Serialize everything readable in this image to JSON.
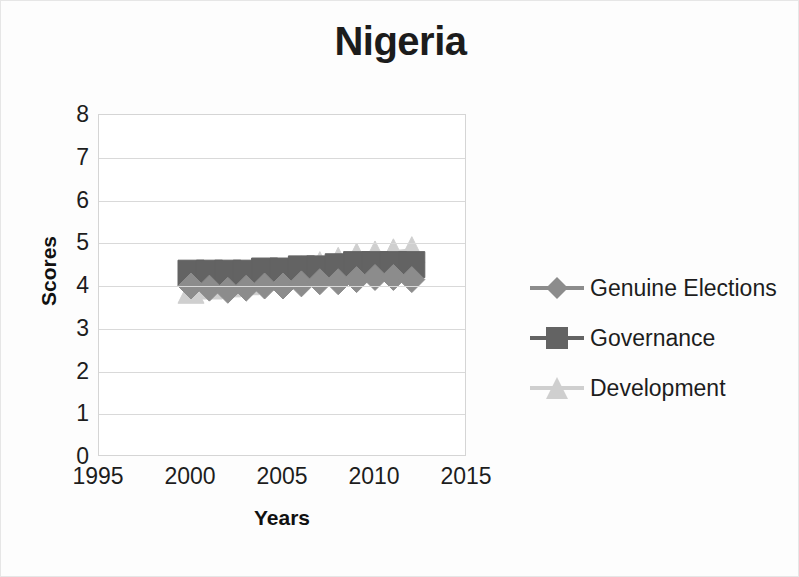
{
  "chart_data": {
    "type": "line",
    "title": "Nigeria",
    "xlabel": "Years",
    "ylabel": "Scores",
    "xlim": [
      1995,
      2015
    ],
    "ylim": [
      0,
      8
    ],
    "xticks": [
      1995,
      2000,
      2005,
      2010,
      2015
    ],
    "yticks": [
      0,
      1,
      2,
      3,
      4,
      5,
      6,
      7,
      8
    ],
    "grid": true,
    "legend_position": "right",
    "x": [
      2000,
      2001,
      2002,
      2003,
      2004,
      2005,
      2006,
      2007,
      2008,
      2009,
      2010,
      2011,
      2012
    ],
    "series": [
      {
        "name": "Genuine Elections",
        "marker": "diamond",
        "color": "#8c8c8c",
        "values": [
          4.0,
          3.95,
          3.9,
          3.95,
          4.0,
          4.0,
          4.05,
          4.1,
          4.1,
          4.15,
          4.2,
          4.2,
          4.15
        ]
      },
      {
        "name": "Governance",
        "marker": "square",
        "color": "#636363",
        "values": [
          4.3,
          4.3,
          4.3,
          4.3,
          4.35,
          4.35,
          4.4,
          4.4,
          4.45,
          4.5,
          4.5,
          4.5,
          4.5
        ]
      },
      {
        "name": "Development",
        "marker": "triangle",
        "color": "#cfcfcf",
        "values": [
          3.9,
          4.0,
          4.05,
          4.1,
          4.2,
          4.3,
          4.4,
          4.5,
          4.6,
          4.7,
          4.75,
          4.8,
          4.85
        ]
      }
    ]
  },
  "legend": {
    "items": [
      {
        "label": "Genuine Elections"
      },
      {
        "label": "Governance"
      },
      {
        "label": "Development"
      }
    ]
  },
  "colors": {
    "genuine_elections": "#8c8c8c",
    "governance": "#636363",
    "development": "#cfcfcf",
    "gridline": "#d9d9d9",
    "axis_text": "#1d1d1d",
    "title_text": "#1c1c1c"
  }
}
